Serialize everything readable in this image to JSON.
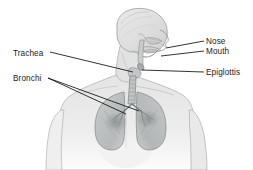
{
  "figure": {
    "background_color": "#ffffff",
    "line_color": "#1a1a1a",
    "text_color": "#1a1a1a",
    "width": 253,
    "height": 170
  },
  "labels": {
    "trachea": "Trachea",
    "bronchi": "Bronchi",
    "nose": "Nose",
    "mouth": "Mouth",
    "epiglottis": "Epiglottis"
  },
  "illustration": {
    "style": "grayscale pencil shaded medical illustration",
    "subject": "upper body of a person shown from the front with head turned to the right, with the respiratory tract visible inside the chest and throat",
    "parts": [
      "head",
      "neck",
      "shoulders",
      "torso",
      "left arm",
      "right arm",
      "nasal cavity",
      "oral cavity",
      "epiglottis",
      "trachea",
      "left lung",
      "right lung",
      "bronchi"
    ],
    "skin_tone": "#e8e8e8",
    "lung_tone": "#b9bcbd",
    "outline_tone": "#8a8d8f"
  },
  "leader_lines": [
    {
      "name": "trachea-leader",
      "from": [
        50,
        52
      ],
      "to": [
        133,
        72
      ]
    },
    {
      "name": "bronchi-leader-1",
      "from": [
        48,
        78
      ],
      "to": [
        139,
        111
      ]
    },
    {
      "name": "bronchi-leader-2",
      "from": [
        48,
        78
      ],
      "to": [
        126,
        114
      ]
    },
    {
      "name": "nose-leader",
      "from": [
        204,
        41
      ],
      "to": [
        166,
        48
      ]
    },
    {
      "name": "mouth-leader",
      "from": [
        204,
        51
      ],
      "to": [
        161,
        56
      ]
    },
    {
      "name": "epiglottis-leader",
      "from": [
        204,
        72
      ],
      "to": [
        142,
        70
      ]
    }
  ]
}
